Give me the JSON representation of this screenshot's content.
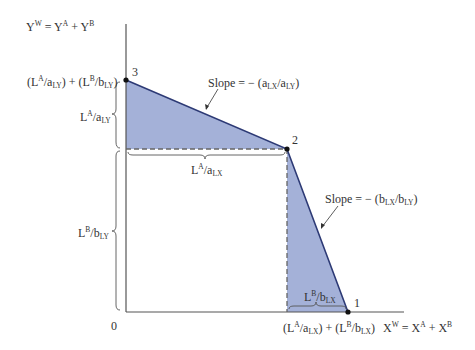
{
  "diagram": {
    "type": "ppf_world_production_possibilities",
    "colors": {
      "fill": "#9aa8d4",
      "line": "#2d3a75",
      "axis": "#555555",
      "dashed": "#666666",
      "point": "#111111"
    },
    "axes": {
      "y_label": {
        "base": "Y",
        "sup": "W",
        "eq": " = Y",
        "sup2": "A",
        "plus": " + Y",
        "sup3": "B"
      },
      "x_label": {
        "base": "X",
        "sup": "W",
        "eq": " = X",
        "sup2": "A",
        "plus": " + X",
        "sup3": "B"
      },
      "origin": "0"
    },
    "points": [
      {
        "id": "1",
        "label": "1"
      },
      {
        "id": "2",
        "label": "2"
      },
      {
        "id": "3",
        "label": "3"
      }
    ],
    "labels": {
      "y_intercept": "(L^A/a_LY) + (L^B/b_LY)",
      "la_aly": "L^A/a_LY",
      "lb_bly": "L^B/b_LY",
      "la_alx": "L^A/a_LX",
      "lb_blx": "L^B/b_LX",
      "x_intercept": "(L^A/a_LX) + (L^B/b_LX)",
      "slope_top": "Slope = − (a_LX/a_LY)",
      "slope_bottom": "Slope = − (b_LX/b_LY)"
    },
    "text": {
      "L": "L",
      "A": "A",
      "B": "B",
      "a": "a",
      "b": "b",
      "LY": "LY",
      "LX": "LX",
      "slash": "/",
      "open": "(",
      "close": ")",
      "plus": " + ",
      "slope": "Slope = − (",
      "one": "1",
      "two": "2",
      "three": "3"
    }
  }
}
